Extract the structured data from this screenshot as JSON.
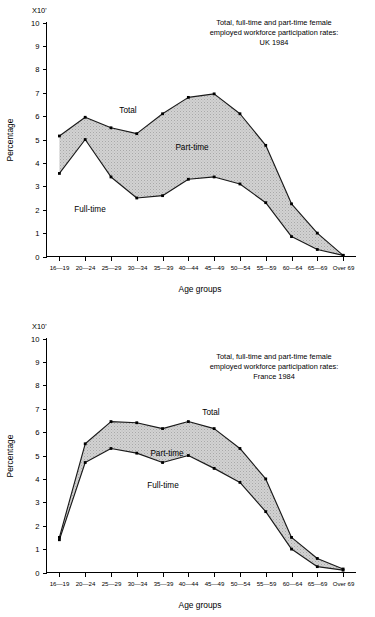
{
  "chart_data": [
    {
      "type": "area",
      "id": "uk-1984",
      "title": "Total, full-time and part-time female employed workforce participation rates: UK 1984",
      "title_lines": [
        "Total, full-time and part-time female",
        "employed workforce participation rates:",
        "UK 1984"
      ],
      "xlabel": "Age groups",
      "ylabel": "Percentage",
      "y_axis_multiplier": "X10'",
      "ylim": [
        0,
        10
      ],
      "yticks": [
        0,
        1,
        2,
        3,
        4,
        5,
        6,
        7,
        8,
        9,
        10
      ],
      "grid": false,
      "legend_position": "inline-annotations",
      "categories": [
        "16—19",
        "20—24",
        "25—29",
        "30—34",
        "35—39",
        "40—44",
        "45—49",
        "50—54",
        "55—59",
        "60—64",
        "65—69",
        "Over 69"
      ],
      "series": [
        {
          "name": "Total",
          "values": [
            5.15,
            5.95,
            5.5,
            5.25,
            6.1,
            6.8,
            6.95,
            6.1,
            4.75,
            2.25,
            1.0,
            0.05
          ]
        },
        {
          "name": "Full-time",
          "values": [
            3.55,
            5.0,
            3.4,
            2.5,
            2.6,
            3.3,
            3.4,
            3.1,
            2.3,
            0.85,
            0.3,
            0.05
          ]
        }
      ],
      "band_label": "Part-time",
      "annotations": [
        {
          "text": "Total",
          "series": "Total"
        },
        {
          "text": "Part-time",
          "series": "band"
        },
        {
          "text": "Full-time",
          "series": "Full-time"
        }
      ]
    },
    {
      "type": "area",
      "id": "france-1984",
      "title": "Total, full-time and part-time female employed workforce participation rates: France 1984",
      "title_lines": [
        "Total, full-time and part-time female",
        "employed workforce participation rates:",
        "France 1984"
      ],
      "xlabel": "Age groups",
      "ylabel": "Percentage",
      "y_axis_multiplier": "X10'",
      "ylim": [
        0,
        10
      ],
      "yticks": [
        0,
        1,
        2,
        3,
        4,
        5,
        6,
        7,
        8,
        9,
        10
      ],
      "grid": false,
      "legend_position": "inline-annotations",
      "categories": [
        "16—19",
        "20—24",
        "25—29",
        "30—34",
        "35—39",
        "40—44",
        "45—49",
        "50—54",
        "55—59",
        "60—64",
        "65—69",
        "Over 69"
      ],
      "series": [
        {
          "name": "Total",
          "values": [
            1.5,
            5.5,
            6.45,
            6.4,
            6.15,
            6.45,
            6.15,
            5.3,
            4.0,
            1.5,
            0.6,
            0.15
          ]
        },
        {
          "name": "Full-time",
          "values": [
            1.4,
            4.7,
            5.3,
            5.1,
            4.7,
            5.0,
            4.45,
            3.85,
            2.6,
            1.0,
            0.25,
            0.1
          ]
        }
      ],
      "band_label": "Part-time",
      "annotations": [
        {
          "text": "Total",
          "series": "Total"
        },
        {
          "text": "Part-time",
          "series": "band"
        },
        {
          "text": "Full-time",
          "series": "Full-time"
        }
      ]
    }
  ],
  "colors": {
    "line": "#1a1a1a",
    "band_fill": "#c9c9c9",
    "background": "#ffffff",
    "text": "#000000"
  }
}
